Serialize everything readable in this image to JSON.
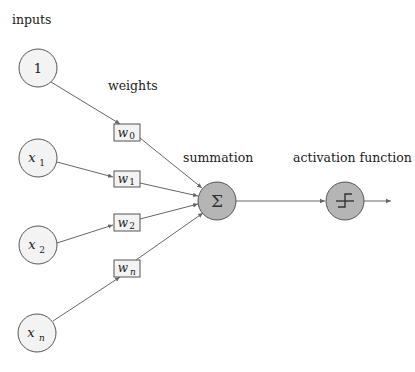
{
  "diagram": {
    "title_inputs": "inputs",
    "title_weights": "weights",
    "title_summation": "summation",
    "title_activation": "activation function",
    "inputs": [
      {
        "id": "bias",
        "label": "1",
        "sub": "",
        "cx": 38,
        "cy": 68
      },
      {
        "id": "x1",
        "label": "x",
        "sub": "1",
        "cx": 38,
        "cy": 158
      },
      {
        "id": "x2",
        "label": "x",
        "sub": "2",
        "cx": 38,
        "cy": 245
      },
      {
        "id": "xn",
        "label": "x",
        "sub": "n",
        "cx": 37,
        "cy": 333
      }
    ],
    "weights": [
      {
        "id": "w0",
        "label": "w",
        "sub": "0",
        "x": 114,
        "y": 124
      },
      {
        "id": "w1",
        "label": "w",
        "sub": "1",
        "x": 114,
        "y": 171
      },
      {
        "id": "w2",
        "label": "w",
        "sub": "2",
        "x": 114,
        "y": 214
      },
      {
        "id": "wn",
        "label": "w",
        "sub": "n",
        "x": 114,
        "y": 260
      }
    ],
    "summation_symbol": "Σ",
    "activation_symbol": "step-function",
    "colors": {
      "input_fill": "#f3f3f3",
      "operator_fill": "#b5b5b5",
      "stroke": "#555555"
    }
  }
}
